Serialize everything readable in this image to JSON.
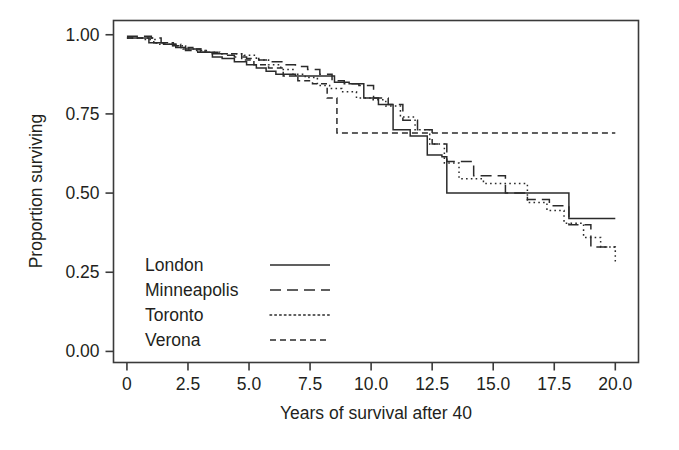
{
  "chart_data": {
    "type": "line",
    "subtype": "kaplan-meier-step",
    "title": "",
    "xlabel": "Years of survival after 40",
    "ylabel": "Proportion surviving",
    "xlim": [
      -0.55,
      20.95
    ],
    "ylim": [
      -0.035,
      1.045
    ],
    "xticks": [
      0,
      2.5,
      5.0,
      7.5,
      10.0,
      12.5,
      15.0,
      17.5,
      20.0
    ],
    "xtick_labels": [
      "0",
      "2.5",
      "5.0",
      "7.5",
      "10.0",
      "12.5",
      "15.0",
      "17.5",
      "20.0"
    ],
    "yticks": [
      0.0,
      0.25,
      0.5,
      0.75,
      1.0
    ],
    "ytick_labels": [
      "0.00",
      "0.25",
      "0.50",
      "0.75",
      "1.00"
    ],
    "grid": false,
    "legend_position": "lower-left-inside",
    "line_color": "#2b2b2b",
    "series": [
      {
        "name": "London",
        "dash": "solid",
        "dasharray": "none",
        "x": [
          0.0,
          0.5,
          0.9,
          1.5,
          2.0,
          2.4,
          3.0,
          3.5,
          3.9,
          4.4,
          4.9,
          5.3,
          5.7,
          6.1,
          6.5,
          6.9,
          7.3,
          7.7,
          8.1,
          8.5,
          9.1,
          9.7,
          10.3,
          10.9,
          11.6,
          12.3,
          12.9,
          13.1,
          17.9,
          18.1,
          20.0
        ],
        "y": [
          0.99,
          0.99,
          0.975,
          0.97,
          0.96,
          0.955,
          0.945,
          0.93,
          0.925,
          0.915,
          0.905,
          0.895,
          0.885,
          0.875,
          0.875,
          0.87,
          0.87,
          0.87,
          0.87,
          0.85,
          0.845,
          0.8,
          0.78,
          0.7,
          0.68,
          0.62,
          0.615,
          0.5,
          0.5,
          0.42,
          0.42
        ],
        "final_value": 0.42
      },
      {
        "name": "Minneapolis",
        "dash": "long-dash",
        "dasharray": "11,6",
        "x": [
          0.0,
          0.6,
          1.0,
          1.4,
          1.9,
          2.4,
          2.9,
          3.4,
          3.9,
          4.4,
          4.9,
          5.4,
          5.9,
          6.4,
          6.9,
          7.4,
          7.9,
          8.4,
          8.9,
          9.5,
          10.1,
          10.7,
          11.3,
          11.9,
          12.5,
          13.1,
          14.2,
          15.5,
          16.4,
          17.3,
          18.1,
          19.0,
          20.0
        ],
        "y": [
          0.995,
          0.995,
          0.99,
          0.975,
          0.965,
          0.95,
          0.945,
          0.94,
          0.935,
          0.93,
          0.925,
          0.92,
          0.915,
          0.905,
          0.9,
          0.89,
          0.875,
          0.855,
          0.845,
          0.84,
          0.8,
          0.78,
          0.73,
          0.7,
          0.655,
          0.6,
          0.555,
          0.5,
          0.48,
          0.46,
          0.4,
          0.33,
          0.33
        ],
        "final_value": 0.33
      },
      {
        "name": "Toronto",
        "dash": "dotted",
        "dasharray": "1.6,3.2",
        "x": [
          0.0,
          0.7,
          1.2,
          1.8,
          2.3,
          2.8,
          3.3,
          3.8,
          4.3,
          4.8,
          5.3,
          5.8,
          6.3,
          6.8,
          7.3,
          7.8,
          8.3,
          8.8,
          9.4,
          10.0,
          10.6,
          11.2,
          11.8,
          12.4,
          13.0,
          13.6,
          14.6,
          15.6,
          16.4,
          17.2,
          17.9,
          18.7,
          19.4,
          20.0
        ],
        "y": [
          0.99,
          0.985,
          0.97,
          0.965,
          0.955,
          0.95,
          0.945,
          0.94,
          0.94,
          0.935,
          0.92,
          0.905,
          0.89,
          0.875,
          0.865,
          0.84,
          0.83,
          0.82,
          0.8,
          0.795,
          0.775,
          0.74,
          0.7,
          0.655,
          0.595,
          0.545,
          0.53,
          0.53,
          0.47,
          0.445,
          0.405,
          0.36,
          0.33,
          0.275
        ],
        "final_value": 0.275
      },
      {
        "name": "Verona",
        "dash": "short-dash",
        "dasharray": "6,4",
        "x": [
          0.0,
          0.6,
          1.1,
          1.7,
          2.2,
          2.7,
          3.2,
          3.7,
          4.2,
          4.7,
          5.2,
          5.8,
          6.4,
          7.0,
          7.6,
          8.2,
          8.6,
          20.0
        ],
        "y": [
          0.99,
          0.99,
          0.975,
          0.97,
          0.96,
          0.955,
          0.945,
          0.94,
          0.94,
          0.92,
          0.905,
          0.895,
          0.87,
          0.855,
          0.845,
          0.8,
          0.69,
          0.69
        ],
        "final_value": 0.69
      }
    ]
  },
  "legend": {
    "entries": [
      {
        "label": "London",
        "style": "solid"
      },
      {
        "label": "Minneapolis",
        "style": "long-dash"
      },
      {
        "label": "Toronto",
        "style": "dotted"
      },
      {
        "label": "Verona",
        "style": "short-dash"
      }
    ]
  },
  "axes": {
    "x_title": "Years of survival after 40",
    "y_title": "Proportion surviving",
    "x_labels": [
      "0",
      "2.5",
      "5.0",
      "7.5",
      "10.0",
      "12.5",
      "15.0",
      "17.5",
      "20.0"
    ],
    "y_labels": [
      "1.00",
      "0.75",
      "0.50",
      "0.25",
      "0.00"
    ]
  }
}
